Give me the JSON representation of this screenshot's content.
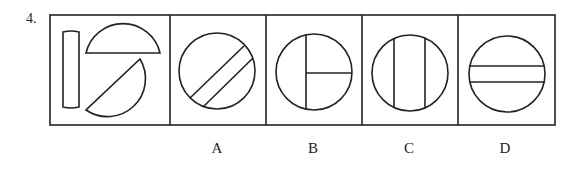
{
  "question": {
    "number": "4.",
    "stem_panel": {
      "description": "Three pieces: a thin vertical rectangle, an upper semicircle, and a lower-right diagonally cut circular segment"
    },
    "options": [
      {
        "label": "A",
        "description": "Circle cut by two parallel diagonal lines (bottom-left to top-right)"
      },
      {
        "label": "B",
        "description": "Circle with vertical line left of center and horizontal line to the right"
      },
      {
        "label": "C",
        "description": "Circle with two vertical parallel lines"
      },
      {
        "label": "D",
        "description": "Circle with two horizontal parallel lines"
      }
    ]
  },
  "colors": {
    "stroke": "#222222",
    "background": "#ffffff"
  }
}
